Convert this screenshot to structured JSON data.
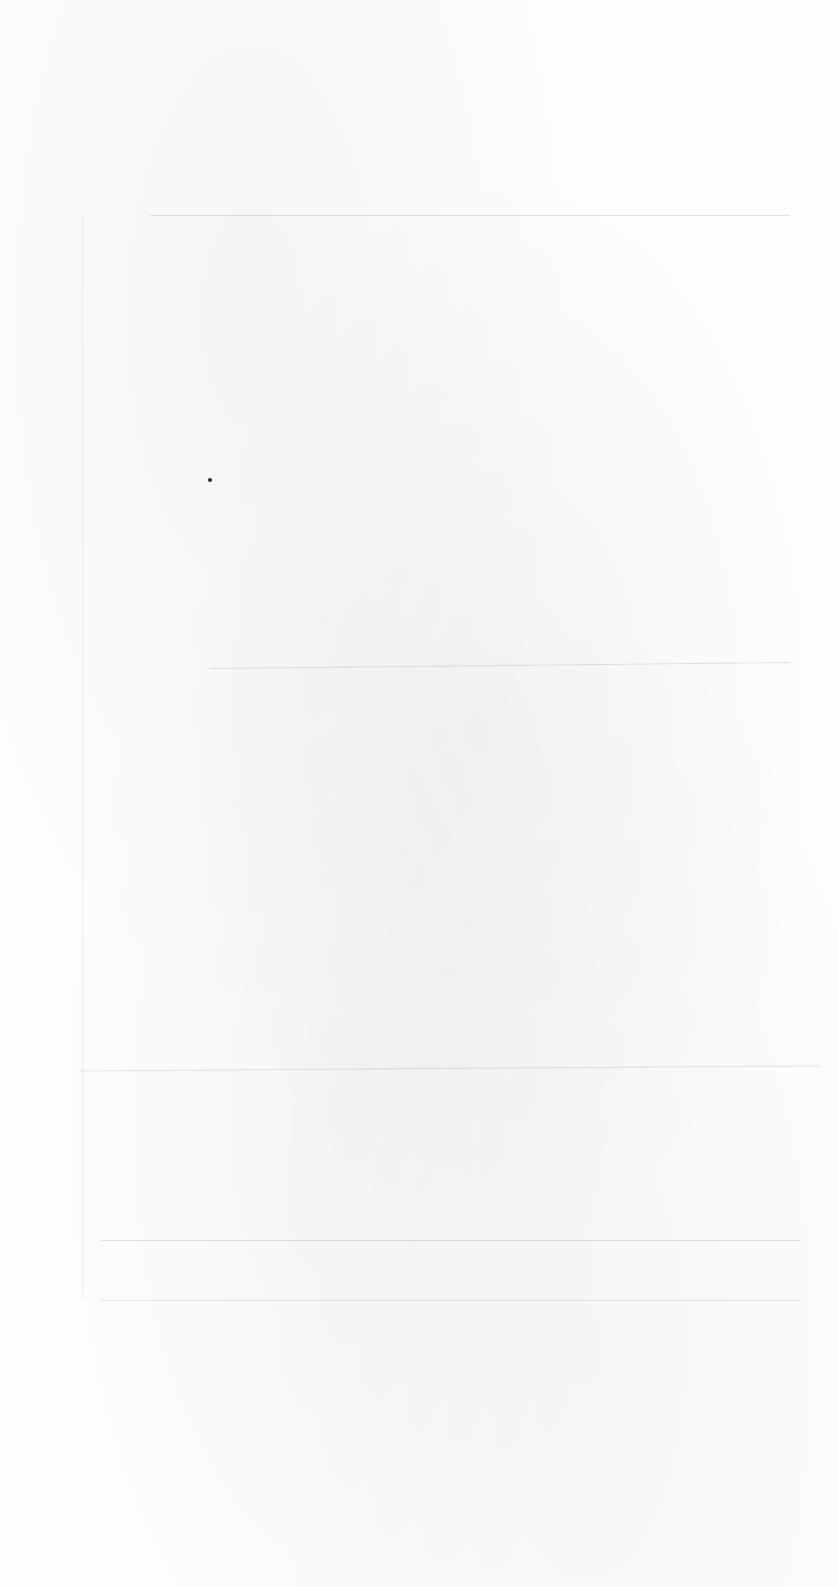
{
  "page": {
    "type": "blank-scanned-page",
    "text": "",
    "background_color": "#fdfdfd",
    "marks": [
      {
        "kind": "dot",
        "x": 210,
        "y": 480
      }
    ],
    "rules_y": [
      215,
      665,
      1065,
      1240,
      1300
    ]
  }
}
